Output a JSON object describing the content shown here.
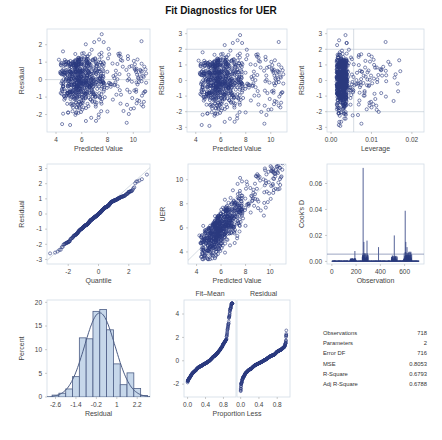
{
  "title": "Fit Diagnostics for UER",
  "colors": {
    "marker": "#2a3a7e",
    "bar_fill": "#c6d7ea",
    "bar_stroke": "#4c5d85",
    "reference": "#b8c4d0",
    "frame": "#d3dce6"
  },
  "chart_data": [
    {
      "id": "residual-vs-predicted",
      "type": "scatter",
      "xlabel": "Predicted Value",
      "ylabel": "Residual",
      "xlim": [
        3.3,
        11.3
      ],
      "ylim": [
        -3,
        2.9
      ],
      "xticks": [
        4,
        6,
        8,
        10
      ],
      "yticks": [
        -2,
        -1,
        0,
        1,
        2
      ],
      "reference_lines": {
        "y": [
          0
        ]
      },
      "n_points": 718,
      "description": "Dense cloud for predicted 3.5-8, fans out sparser for 8-11; residuals range about -2.6 to 2.6"
    },
    {
      "id": "rstudent-vs-predicted",
      "type": "scatter",
      "xlabel": "Predicted Value",
      "ylabel": "RStudent",
      "xlim": [
        3.3,
        11.3
      ],
      "ylim": [
        -3.3,
        3.3
      ],
      "xticks": [
        4,
        6,
        8,
        10
      ],
      "yticks": [
        -3,
        -2,
        -1,
        0,
        1,
        2,
        3
      ],
      "reference_lines": {
        "y": [
          -2,
          2
        ]
      },
      "n_points": 718
    },
    {
      "id": "rstudent-vs-leverage",
      "type": "scatter",
      "xlabel": "Leverage",
      "ylabel": "RStudent",
      "xlim": [
        -0.001,
        0.023
      ],
      "ylim": [
        -3.3,
        3.3
      ],
      "xtick_labels": [
        "0.00",
        "0.01",
        "0.02"
      ],
      "xticks": [
        0,
        0.01,
        0.02
      ],
      "yticks": [
        -3,
        -2,
        -1,
        0,
        1,
        2,
        3
      ],
      "reference_lines": {
        "y": [
          -2,
          2
        ],
        "x": [
          0.0056
        ]
      },
      "n_points": 718,
      "description": "Most points at leverage 0.0014-0.005; sparse points up to 0.021"
    },
    {
      "id": "residual-qq",
      "type": "scatter",
      "xlabel": "Quantile",
      "ylabel": "Residual",
      "xlim": [
        -3.4,
        3.4
      ],
      "ylim": [
        -3.3,
        3.3
      ],
      "xticks": [
        -2,
        0,
        2
      ],
      "yticks": [
        -3,
        -2,
        -1,
        0,
        1,
        2,
        3
      ],
      "reference_line": "diagonal",
      "n_points": 718
    },
    {
      "id": "uer-vs-predicted",
      "type": "scatter",
      "xlabel": "Predicted Value",
      "ylabel": "UER",
      "xlim": [
        3.3,
        11.3
      ],
      "ylim": [
        3.0,
        11.3
      ],
      "xticks": [
        4,
        6,
        8,
        10
      ],
      "yticks": [
        4,
        6,
        8,
        10
      ],
      "reference_line": "diagonal",
      "n_points": 718
    },
    {
      "id": "cooks-d",
      "type": "bar",
      "xlabel": "Observation",
      "ylabel": "Cook's D",
      "xlim": [
        -40,
        760
      ],
      "ylim": [
        -0.002,
        0.075
      ],
      "xticks": [
        0,
        200,
        400,
        600
      ],
      "ytick_labels": [
        "0.00",
        "0.02",
        "0.04",
        "0.06"
      ],
      "yticks": [
        0,
        0.02,
        0.04,
        0.06
      ],
      "reference_lines": {
        "y": [
          0.0056
        ]
      },
      "spikes": [
        {
          "obs": 190,
          "value": 0.008
        },
        {
          "obs": 258,
          "value": 0.072
        },
        {
          "obs": 264,
          "value": 0.015
        },
        {
          "obs": 290,
          "value": 0.016
        },
        {
          "obs": 385,
          "value": 0.011
        },
        {
          "obs": 515,
          "value": 0.02
        },
        {
          "obs": 605,
          "value": 0.039
        },
        {
          "obs": 610,
          "value": 0.015
        },
        {
          "obs": 620,
          "value": 0.011
        }
      ]
    },
    {
      "id": "residual-histogram",
      "type": "bar",
      "xlabel": "Residual",
      "ylabel": "Percent",
      "xlim": [
        -3.1,
        2.95
      ],
      "ylim": [
        0,
        20.5
      ],
      "xtick_labels": [
        "-2.6",
        "-1.4",
        "-0.2",
        "1",
        "2.2"
      ],
      "xticks": [
        -2.6,
        -1.4,
        -0.2,
        1,
        2.2
      ],
      "yticks": [
        0,
        5,
        10,
        15,
        20
      ],
      "bin_width": 0.4,
      "bin_centers": [
        -2.6,
        -2.2,
        -1.8,
        -1.4,
        -1.0,
        -0.6,
        -0.2,
        0.2,
        0.6,
        1.0,
        1.4,
        1.8,
        2.2,
        2.6
      ],
      "values": [
        0.4,
        0.8,
        1.7,
        4.3,
        12.5,
        12.3,
        18.1,
        18.5,
        14.2,
        7.0,
        2.6,
        5.1,
        1.8,
        0.3
      ],
      "normal_curve": {
        "mean": 0,
        "sd": 0.897
      }
    },
    {
      "id": "residual-fit-spread",
      "type": "scatter",
      "xlabel": "Proportion Less",
      "panels": [
        "Fit–Mean",
        "Residual"
      ],
      "xlim": [
        -0.08,
        1.08
      ],
      "ylim": [
        -3.1,
        5.2
      ],
      "xtick_labels": [
        "0.0",
        "0.4",
        "0.8"
      ],
      "xticks": [
        0,
        0.4,
        0.8
      ],
      "yticks": [
        -2,
        0,
        2,
        4
      ],
      "fit_mean_range": [
        -2.4,
        4.9
      ],
      "residual_range": [
        -2.6,
        2.6
      ]
    }
  ],
  "stats_table": [
    {
      "label": "Observations",
      "value": "718"
    },
    {
      "label": "Parameters",
      "value": "2"
    },
    {
      "label": "Error DF",
      "value": "716"
    },
    {
      "label": "MSE",
      "value": "0.8053"
    },
    {
      "label": "R-Square",
      "value": "0.6793"
    },
    {
      "label": "Adj R-Square",
      "value": "0.6788"
    }
  ]
}
